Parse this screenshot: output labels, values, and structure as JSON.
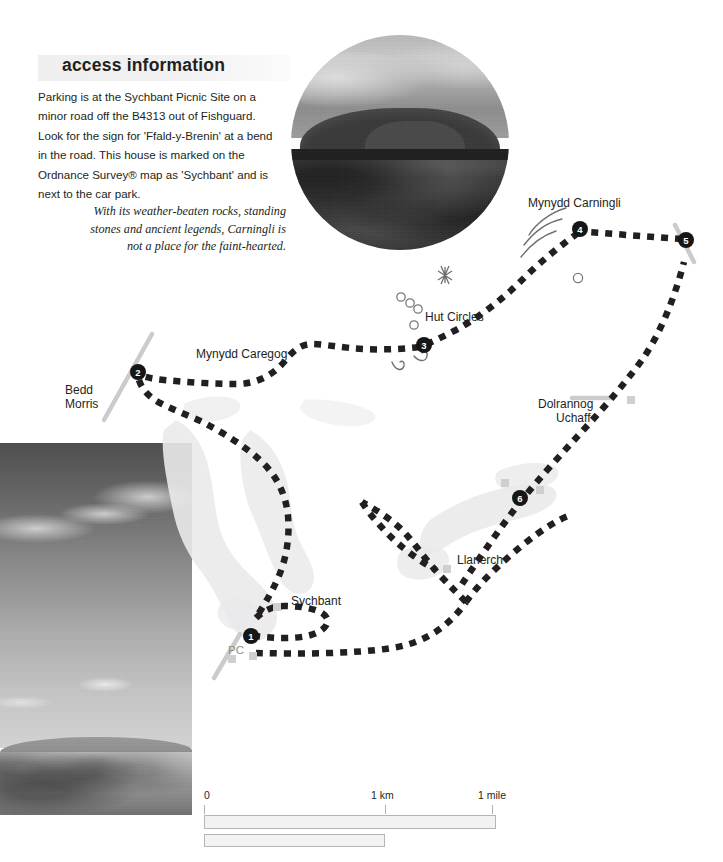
{
  "access": {
    "title": "access information",
    "body": "Parking is at the Sychbant Picnic Site on a minor road off the B4313 out of Fishguard. Look for the sign for 'Ffald-y-Brenin' at a bend in the road. This house is marked on the Ordnance Survey® map as 'Sychbant' and is next to the car park."
  },
  "photo_caption": "With its weather-beaten rocks, standing stones and ancient legends, Carningli is not a place for the faint-hearted.",
  "map": {
    "labels": [
      {
        "id": "mynydd-carningli",
        "text": "Mynydd Carningli",
        "x": 528,
        "y": 196,
        "align": "left"
      },
      {
        "id": "hut-circles",
        "text": "Hut Circles",
        "x": 425,
        "y": 310,
        "align": "left"
      },
      {
        "id": "mynydd-caregog",
        "text": "Mynydd Caregog",
        "x": 196,
        "y": 347,
        "align": "left"
      },
      {
        "id": "bedd-morris-line1",
        "text": "Bedd",
        "x": 65,
        "y": 383,
        "align": "left"
      },
      {
        "id": "bedd-morris-line2",
        "text": "Morris",
        "x": 65,
        "y": 397,
        "align": "left"
      },
      {
        "id": "dolrannog-line1",
        "text": "Dolrannog",
        "x": 538,
        "y": 397,
        "align": "left"
      },
      {
        "id": "dolrannog-line2",
        "text": "Uchaff",
        "x": 556,
        "y": 411,
        "align": "left"
      },
      {
        "id": "llanerch",
        "text": "Llanerch",
        "x": 457,
        "y": 553,
        "align": "left"
      },
      {
        "id": "sychbant",
        "text": "Sychbant",
        "x": 291,
        "y": 594,
        "align": "left"
      },
      {
        "id": "public-conveniences",
        "text": "PC",
        "x": 228,
        "y": 643,
        "align": "left"
      }
    ],
    "waypoints": [
      {
        "number": "1",
        "x": 251,
        "y": 636
      },
      {
        "number": "2",
        "x": 138,
        "y": 372
      },
      {
        "number": "3",
        "x": 424,
        "y": 345
      },
      {
        "number": "4",
        "x": 580,
        "y": 229
      },
      {
        "number": "5",
        "x": 686,
        "y": 240
      },
      {
        "number": "6",
        "x": 520,
        "y": 498
      }
    ],
    "symbols": {
      "star": {
        "name": "standing-stone-star",
        "x": 445,
        "y": 275
      },
      "hut_circles": [
        {
          "x": 401,
          "y": 297
        },
        {
          "x": 410,
          "y": 303
        },
        {
          "x": 418,
          "y": 309
        },
        {
          "x": 414,
          "y": 325
        }
      ],
      "spot_circles": [
        {
          "x": 578,
          "y": 278
        }
      ],
      "buildings": [
        {
          "x": 631,
          "y": 400
        },
        {
          "x": 505,
          "y": 483
        },
        {
          "x": 540,
          "y": 490
        },
        {
          "x": 447,
          "y": 569
        },
        {
          "x": 277,
          "y": 607
        },
        {
          "x": 253,
          "y": 656
        },
        {
          "x": 232,
          "y": 659
        }
      ]
    },
    "colors": {
      "route": "#231f20",
      "road": "#c9c9c9",
      "woodland": "#e9e9ea",
      "label": "#231f20",
      "pc_label": "#8e8e8e"
    }
  },
  "scale": {
    "ticks": [
      {
        "label": "0",
        "x": 0
      },
      {
        "label": "1 km",
        "x": 181
      },
      {
        "label": "1 mile",
        "x": 288
      }
    ],
    "bars": [
      {
        "id": "km-bar",
        "width": 292
      },
      {
        "id": "mile-bar",
        "width": 181
      }
    ]
  }
}
